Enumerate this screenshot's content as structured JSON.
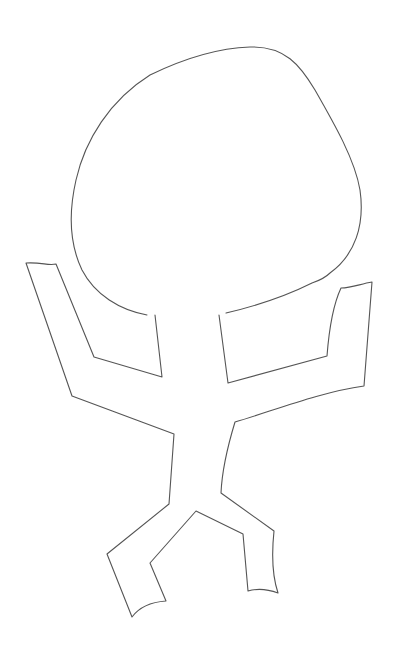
{
  "drawing": {
    "subject": "stick figure with round head and raised arms",
    "stroke_color": "#555555",
    "background_color": "#ffffff"
  }
}
